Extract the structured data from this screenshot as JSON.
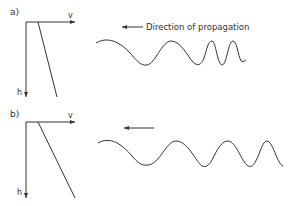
{
  "panels": [
    {
      "label": "a)",
      "axis_x_label": "v",
      "axis_y_label": "h",
      "arrow_label": "Direction of propagation",
      "description": "velocity slightly increasing with depth; wave compressed toward front"
    },
    {
      "label": "b)",
      "axis_x_label": "v",
      "axis_y_label": "h",
      "arrow_label": "",
      "description": "velocity strongly increasing with depth; gradual wave compression"
    }
  ],
  "colors": {
    "stroke": "#333333",
    "background": "#ffffff"
  }
}
